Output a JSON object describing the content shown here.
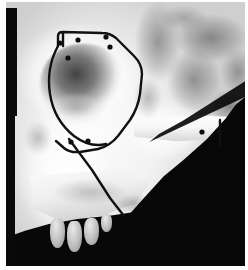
{
  "figure": {
    "kind": "radiograph-photograph",
    "caption": "",
    "background_color": "#ffffff",
    "plate": {
      "x": 6,
      "y": 2,
      "width": 239,
      "height": 264,
      "bone_tone": "#f3f3f3",
      "shadow_tone": "#070707",
      "mid_tone": "#9e9e9e"
    },
    "borders": {
      "left_strip_color": "#0a0a0a",
      "left_strip_x": 0,
      "left_strip_width": 11
    }
  },
  "anatomy": {
    "orbit": {
      "label": "orbital cavity",
      "cx": 76,
      "cy": 83,
      "rx": 42,
      "ry": 41,
      "tone": "#4a4a4a"
    },
    "temporal_fossa": {
      "label": "temporal fossa mottled texture",
      "cx": 186,
      "cy": 60
    },
    "zygomatic_arch": {
      "label": "zygomatic arch",
      "x": 128,
      "y": 112,
      "width": 106,
      "height": 34
    },
    "maxilla": {
      "label": "maxillary alveolar shelf",
      "x": 24,
      "y": 168,
      "width": 122,
      "height": 54
    },
    "nasal_aperture": {
      "label": "nasal aperture profile",
      "x": 18,
      "y": 118
    },
    "teeth": [
      {
        "label": "tooth-1",
        "x": 44,
        "y": 216,
        "width": 15,
        "height": 30
      },
      {
        "label": "tooth-2",
        "x": 61,
        "y": 219,
        "width": 15,
        "height": 31
      },
      {
        "label": "tooth-3",
        "x": 78,
        "y": 216,
        "width": 15,
        "height": 27
      },
      {
        "label": "tooth-4",
        "x": 95,
        "y": 212,
        "width": 11,
        "height": 18
      }
    ]
  },
  "tracing": {
    "stroke_color": "#111111",
    "stroke_width": 2.4,
    "description": "hand-inked osteotomy outline around lateral orbital rim and zygoma",
    "outline_path": "M 52 44 L 52 34 Q 52 30 57 30 L 96 31 Q 104 31 110 36 L 128 54 Q 136 62 136 72 L 134 92 Q 132 106 124 118 L 112 134 Q 104 144 92 147 L 74 150 Q 64 151 58 146 L 50 139",
    "inner_arc_path": "M 52 44 Q 40 66 44 92 Q 48 118 68 134 Q 84 146 100 142",
    "descender_path": "M 63 137 L 86 168 L 104 196 L 118 214",
    "arch_marker_path": "M 214 118 L 214 144",
    "band_path": "M 57 31 L 57 44"
  },
  "markers": {
    "color": "#0d0d0d",
    "radius": 2.6,
    "points": [
      {
        "id": "m1",
        "x": 54,
        "y": 41,
        "note": "superior-lateral, left of notch"
      },
      {
        "id": "m2",
        "x": 72,
        "y": 38,
        "note": "along superior border"
      },
      {
        "id": "m3",
        "x": 100,
        "y": 35,
        "note": "top-right of outline"
      },
      {
        "id": "m4",
        "x": 104,
        "y": 45,
        "note": "below top-right corner"
      },
      {
        "id": "m5",
        "x": 62,
        "y": 56,
        "note": "inside orbit, upper-left"
      },
      {
        "id": "m6",
        "x": 65,
        "y": 140,
        "note": "inferior junction left"
      },
      {
        "id": "m7",
        "x": 82,
        "y": 139,
        "note": "inferior junction right"
      },
      {
        "id": "m8",
        "x": 196,
        "y": 130,
        "note": "zygomatic arch, medial dot"
      },
      {
        "id": "m9",
        "x": 212,
        "y": 129,
        "note": "zygomatic arch, lateral dot"
      }
    ]
  },
  "labels": {
    "visible_text": []
  }
}
